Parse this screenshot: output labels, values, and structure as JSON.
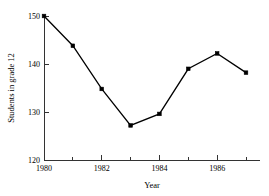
{
  "chart_data": {
    "type": "line",
    "title": "",
    "xlabel": "Year",
    "ylabel": "Students in grade 12",
    "x": [
      1980,
      1981,
      1982,
      1983,
      1984,
      1985,
      1986,
      1987
    ],
    "values": [
      150.0,
      143.8,
      134.8,
      127.2,
      129.6,
      139.0,
      142.2,
      138.2
    ],
    "series": [
      {
        "name": "Students in grade 12",
        "values": [
          150.0,
          143.8,
          134.8,
          127.2,
          129.6,
          139.0,
          142.2,
          138.2
        ]
      }
    ],
    "xlim": [
      1980,
      1987
    ],
    "ylim": [
      120,
      150
    ],
    "xticks": [
      1980,
      1982,
      1984,
      1986
    ],
    "xtick_labels": [
      "1980",
      "1982",
      "1984",
      "1986"
    ],
    "xticks_minor": [
      1981,
      1983,
      1985,
      1987
    ],
    "yticks": [
      120,
      130,
      140,
      150
    ],
    "ytick_labels": [
      "120",
      "130",
      "140",
      "150"
    ],
    "grid": false,
    "legend": false,
    "marker": "filled-square",
    "line_color": "#000000",
    "marker_color": "#000000",
    "axis_color": "#333333",
    "background": "#ffffff"
  }
}
